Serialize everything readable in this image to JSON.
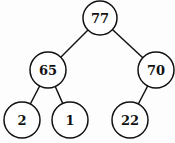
{
  "tree": {
    "nodes": [
      {
        "id": "n77",
        "value": "77",
        "x": 100,
        "y": 18
      },
      {
        "id": "n65",
        "value": "65",
        "x": 48,
        "y": 70
      },
      {
        "id": "n70",
        "value": "70",
        "x": 156,
        "y": 70
      },
      {
        "id": "n2",
        "value": "2",
        "x": 22,
        "y": 120
      },
      {
        "id": "n1",
        "value": "1",
        "x": 70,
        "y": 120
      },
      {
        "id": "n22",
        "value": "22",
        "x": 130,
        "y": 120
      }
    ],
    "edges": [
      [
        "n77",
        "n65"
      ],
      [
        "n77",
        "n70"
      ],
      [
        "n65",
        "n2"
      ],
      [
        "n65",
        "n1"
      ],
      [
        "n70",
        "n22"
      ]
    ]
  }
}
